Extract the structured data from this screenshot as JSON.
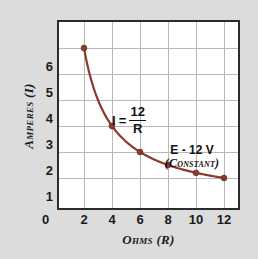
{
  "chart_data": {
    "type": "line",
    "title": "",
    "xlabel": "Ohms (R)",
    "ylabel": "Amperes (I)",
    "xlim": [
      0,
      13
    ],
    "ylim": [
      0,
      6.6
    ],
    "grid": true,
    "legend": "none",
    "series": [
      {
        "name": "I = 12/R",
        "color": "#8b3a2e",
        "x": [
          2,
          4,
          6,
          8,
          10,
          12
        ],
        "values": [
          6,
          3,
          2,
          1.5,
          1.2,
          1
        ]
      }
    ],
    "x_ticks": [
      "2",
      "4",
      "6",
      "8",
      "10",
      "12"
    ],
    "x_tick_values": [
      2,
      4,
      6,
      8,
      10,
      12
    ],
    "y_ticks": [
      "1",
      "2",
      "3",
      "4",
      "5",
      "6"
    ],
    "y_tick_values": [
      1,
      2,
      3,
      4,
      5,
      6
    ],
    "origin_label": "0",
    "annotations": [
      {
        "name": "formula",
        "lhs": "I",
        "equals": "=",
        "numerator": "12",
        "denominator": "R"
      },
      {
        "name": "constant-note",
        "line1": "E - 12 V",
        "line2": "(Constant)"
      }
    ]
  },
  "colors": {
    "page_background": "#dcdcdc",
    "plot_background": "#ffffff",
    "frame": "#2b2b2b",
    "gridline": "#b9b9b9",
    "curve": "#8b3a2e",
    "marker": "#8b3a2e",
    "text": "#1a1a1a"
  }
}
